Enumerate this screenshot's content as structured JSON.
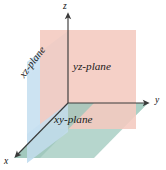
{
  "figure": {
    "background_color": "#ffffff"
  },
  "axes": [
    {
      "key": "z",
      "label": "z",
      "direction": "up",
      "arrow": true
    },
    {
      "key": "y",
      "label": "y",
      "direction": "right",
      "arrow": true
    },
    {
      "key": "x",
      "label": "x",
      "direction": "down-left",
      "arrow": true
    }
  ],
  "axis_labels": {
    "x": "x",
    "y": "y",
    "z": "z"
  },
  "planes": [
    {
      "key": "yz",
      "label": "yz-plane",
      "color": "#f4c9bf",
      "shape": "rectangle",
      "orientation": "vertical-facing-x"
    },
    {
      "key": "xz",
      "label": "xz-plane",
      "color": "#c5dff0",
      "shape": "parallelogram",
      "orientation": "vertical-facing-y",
      "label_rotation_deg": -53
    },
    {
      "key": "xy",
      "label": "xy-plane",
      "color": "#a9cfc4",
      "shape": "parallelogram",
      "orientation": "horizontal"
    }
  ],
  "colors": {
    "yz_plane": "#f4c9bf",
    "xz_plane": "#c5dff0",
    "xy_plane": "#a9cfc4",
    "axis_line": "#3a3a3a",
    "text": "#1a1a1a",
    "background": "#ffffff"
  }
}
